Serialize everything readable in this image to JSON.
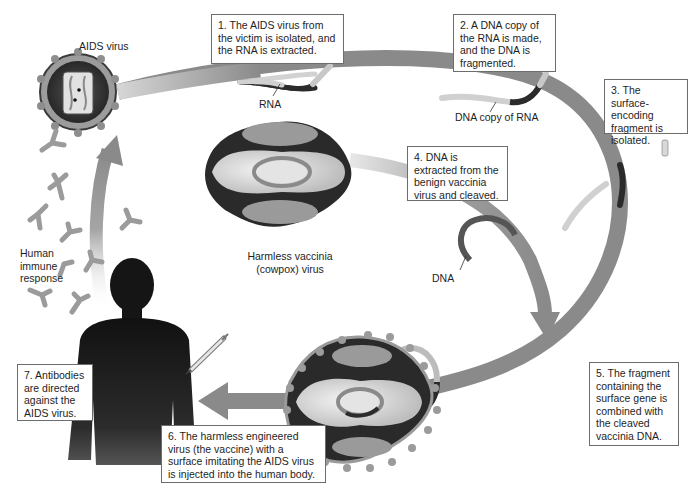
{
  "steps": [
    {
      "id": 1,
      "text": "1. The AIDS virus from the victim is isolated, and the RNA is extracted."
    },
    {
      "id": 2,
      "text": "2. A DNA copy of the RNA is made, and the DNA is fragmented."
    },
    {
      "id": 3,
      "text": "3. The surface-encoding fragment is isolated."
    },
    {
      "id": 4,
      "text": "4. DNA is extracted from the benign vaccinia virus and cleaved."
    },
    {
      "id": 5,
      "text": "5. The fragment containing the surface gene is combined with the cleaved vaccinia DNA."
    },
    {
      "id": 6,
      "text": "6. The harmless engineered virus (the vaccine) with a surface imitating the AIDS virus is injected into the human body."
    },
    {
      "id": 7,
      "text": "7. Antibodies are directed against the AIDS virus."
    }
  ],
  "labels": {
    "aids_virus": "AIDS virus",
    "rna": "RNA",
    "dna_copy": "DNA copy of RNA",
    "vaccinia_line1": "Harmless vaccinia",
    "vaccinia_line2": "(cowpox) virus",
    "dna": "DNA",
    "immune_line1": "Human",
    "immune_line2": "immune",
    "immune_line3": "response"
  },
  "colors": {
    "arrow": "#8a8a8a",
    "arrow_light": "#c9c9c9",
    "dark": "#2e2e2e",
    "tube_light": "#d4d4d4",
    "silhouette": "#1c1c1c",
    "capsid_light": "#e6e6e6",
    "capsid_mid": "#9a9a9a"
  }
}
